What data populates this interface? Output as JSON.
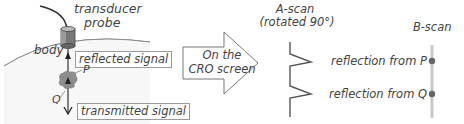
{
  "left_panel": {
    "probe_label_line1": "transducer",
    "probe_label_line2": "probe",
    "body_label": "body",
    "reflected_label": "reflected signal",
    "point_p": "P",
    "point_q": "Q",
    "transmitted_label": "transmitted signal"
  },
  "arrow": {
    "line1": "On the",
    "line2": "CRO screen"
  },
  "a_scan": {
    "title_line1": "A-scan",
    "title_line2": "(rotated 90°)",
    "reflection_p": "reflection from P",
    "reflection_q": "reflection from Q"
  },
  "b_scan": {
    "title": "B-scan"
  }
}
